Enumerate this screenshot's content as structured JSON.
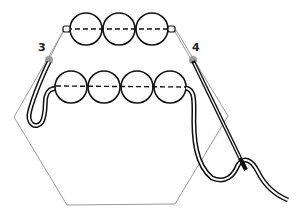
{
  "diagram": {
    "type": "beading-stitch-illustration",
    "labels": [
      {
        "id": "point-3",
        "text": "3",
        "x": 28,
        "y": 41
      },
      {
        "id": "point-4",
        "text": "4",
        "x": 191,
        "y": 41
      }
    ],
    "colors": {
      "outline": "#111111",
      "hexagon": "#9a9a9a",
      "point": "#9c9c9c",
      "thread_fill": "#ffffff"
    },
    "top_row_beads": 3,
    "bottom_row_beads": 4
  }
}
